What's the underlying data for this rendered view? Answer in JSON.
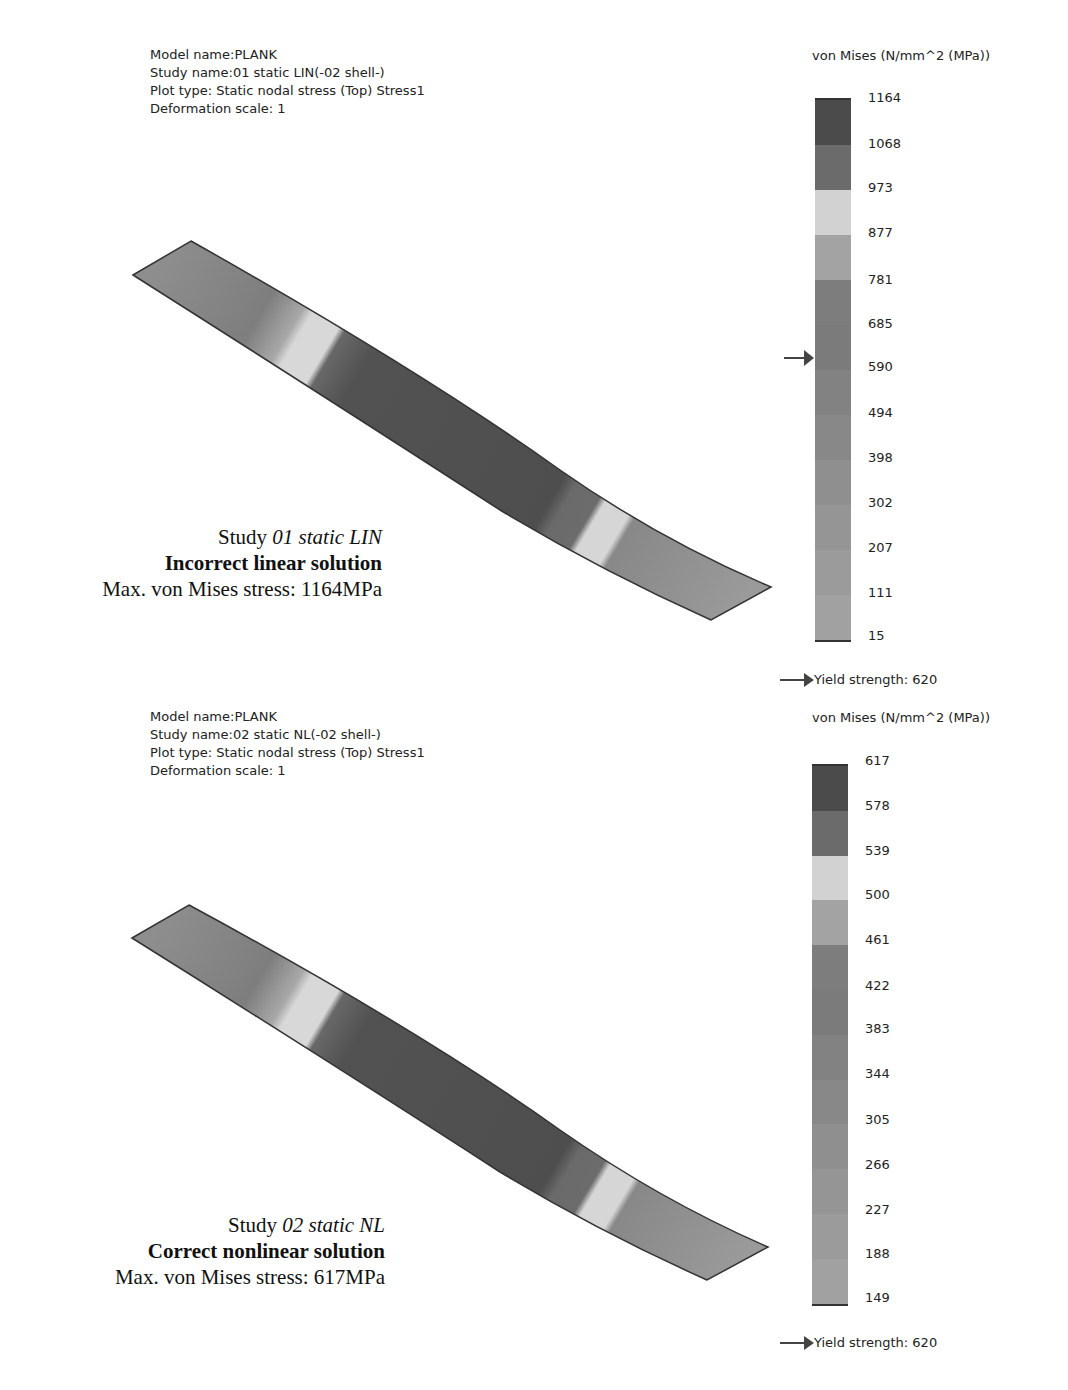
{
  "panels": [
    {
      "info": {
        "model_name": "Model name:PLANK",
        "study_name": "Study name:01 static LIN(-02 shell-)",
        "plot_type": "Plot type: Static nodal stress (Top) Stress1",
        "deformation_scale": "Deformation scale: 1"
      },
      "legend": {
        "title": "von Mises (N/mm^2 (MPa))",
        "ticks": [
          "1164",
          "1068",
          "973",
          "877",
          "781",
          "685",
          "590",
          "494",
          "398",
          "302",
          "207",
          "111",
          "15"
        ],
        "yield_label": "Yield strength: 620",
        "pointer_value": "620"
      },
      "caption": {
        "study_prefix": "Study ",
        "study_name": "01 static LIN",
        "verdict": "Incorrect linear solution",
        "max_stress": "Max. von Mises stress: 1164MPa"
      }
    },
    {
      "info": {
        "model_name": "Model name:PLANK",
        "study_name": "Study name:02 static NL(-02 shell-)",
        "plot_type": "Plot type: Static nodal stress (Top) Stress1",
        "deformation_scale": "Deformation scale: 1"
      },
      "legend": {
        "title": "von Mises (N/mm^2 (MPa))",
        "ticks": [
          "617",
          "578",
          "539",
          "500",
          "461",
          "422",
          "383",
          "344",
          "305",
          "266",
          "227",
          "188",
          "149"
        ],
        "yield_label": "Yield strength: 620"
      },
      "caption": {
        "study_prefix": "Study ",
        "study_name": "02 static NL",
        "verdict": "Correct nonlinear solution",
        "max_stress": "Max. von Mises stress: 617MPa"
      }
    }
  ],
  "colorbar_bands": [
    "#4a4a4a",
    "#6a6a6a",
    "#d4d4d4",
    "#a2a2a2",
    "#7e7e7e",
    "#7a7a7a",
    "#808080",
    "#868686",
    "#8e8e8e",
    "#949494",
    "#9a9a9a",
    "#a0a0a0"
  ]
}
